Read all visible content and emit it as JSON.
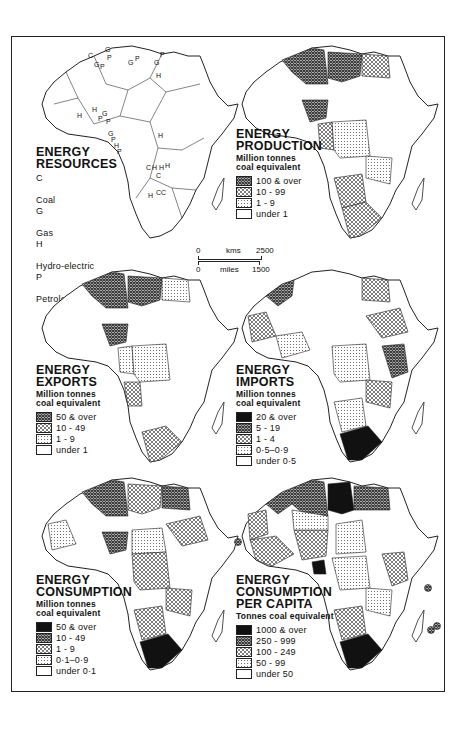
{
  "colors": {
    "ink": "#222222",
    "paper": "#ffffff",
    "solid_black": "#111111",
    "dense_hatch": "#555555",
    "cross_hatch": "#8a8a8a",
    "dot_stipple": "#bbbbbb"
  },
  "scale_bar": {
    "kms_start": "0",
    "kms_unit": "kms",
    "kms_end": "2500",
    "miles_start": "0",
    "miles_unit": "miles",
    "miles_end": "1500"
  },
  "panels": [
    {
      "id": "energy-resources",
      "title_line1": "ENERGY",
      "title_line2": "RESOURCES",
      "legend_key": [
        {
          "code": "C",
          "label": "Coal"
        },
        {
          "code": "G",
          "label": "Gas"
        },
        {
          "code": "H",
          "label": "Hydro-electric"
        },
        {
          "code": "P",
          "label": "Petroleum"
        }
      ],
      "map_labels": [
        "C",
        "G",
        "P",
        "G",
        "P",
        "G",
        "P",
        "G",
        "P",
        "H",
        "H",
        "H",
        "G",
        "P",
        "P",
        "G",
        "P",
        "H",
        "P",
        "H",
        "C",
        "H",
        "H",
        "C",
        "H",
        "C"
      ]
    },
    {
      "id": "energy-production",
      "title_line1": "ENERGY",
      "title_line2": "PRODUCTION",
      "unit_line1": "Million tonnes",
      "unit_line2": "coal equivalent",
      "legend": [
        {
          "pattern": "dense",
          "label": "100 & over"
        },
        {
          "pattern": "cross",
          "label": "10 - 99"
        },
        {
          "pattern": "dots",
          "label": "1 - 9"
        },
        {
          "pattern": "none",
          "label": "under 1"
        }
      ]
    },
    {
      "id": "energy-exports",
      "title_line1": "ENERGY",
      "title_line2": "EXPORTS",
      "unit_line1": "Million tonnes",
      "unit_line2": "coal equivalent",
      "legend": [
        {
          "pattern": "dense",
          "label": "50 & over"
        },
        {
          "pattern": "cross",
          "label": "10 - 49"
        },
        {
          "pattern": "dots",
          "label": "1 - 9"
        },
        {
          "pattern": "none",
          "label": "under 1"
        }
      ]
    },
    {
      "id": "energy-imports",
      "title_line1": "ENERGY",
      "title_line2": "IMPORTS",
      "unit_line1": "Million tonnes",
      "unit_line2": "coal equivalent",
      "legend": [
        {
          "pattern": "solid",
          "label": "20 & over"
        },
        {
          "pattern": "dense",
          "label": "5 - 19"
        },
        {
          "pattern": "cross",
          "label": "1 - 4"
        },
        {
          "pattern": "dots",
          "label": "0·5–0·9"
        },
        {
          "pattern": "none",
          "label": "under 0·5"
        }
      ]
    },
    {
      "id": "energy-consumption",
      "title_line1": "ENERGY",
      "title_line2": "CONSUMPTION",
      "unit_line1": "Million tonnes",
      "unit_line2": "coal equivalent",
      "legend": [
        {
          "pattern": "solid",
          "label": "50 & over"
        },
        {
          "pattern": "dense",
          "label": "10 - 49"
        },
        {
          "pattern": "cross",
          "label": "1 - 9"
        },
        {
          "pattern": "dots",
          "label": "0·1–0·9"
        },
        {
          "pattern": "none",
          "label": "under 0·1"
        }
      ]
    },
    {
      "id": "energy-consumption-per-capita",
      "title_line1": "ENERGY",
      "title_line2": "CONSUMPTION",
      "title_line3": "PER CAPITA",
      "unit_line1": "Tonnes coal equivalent",
      "legend": [
        {
          "pattern": "solid",
          "label": "1000 & over"
        },
        {
          "pattern": "dense",
          "label": "250 - 999"
        },
        {
          "pattern": "cross",
          "label": "100 - 249"
        },
        {
          "pattern": "dots",
          "label": "50 - 99"
        },
        {
          "pattern": "none",
          "label": "under 50"
        }
      ]
    }
  ]
}
